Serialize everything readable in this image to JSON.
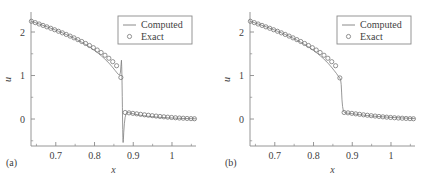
{
  "figure": {
    "panels": [
      {
        "tag": "(a)",
        "name": "panel-a"
      },
      {
        "tag": "(b)",
        "name": "panel-b"
      }
    ],
    "legend": {
      "computed_label": "Computed",
      "exact_label": "Exact"
    },
    "colors": {
      "axis": "#8a8a8a",
      "curve": "#7d7d7d",
      "marker": "#6f6f6f",
      "text": "#3f3f3f",
      "background": "#ffffff"
    }
  },
  "chart_data": [
    {
      "type": "line",
      "title": "(a)",
      "xlabel": "x",
      "ylabel": "u",
      "xlim": [
        0.636,
        1.062
      ],
      "ylim": [
        -0.62,
        2.46
      ],
      "xticks": [
        0.7,
        0.8,
        0.9,
        1.0
      ],
      "xticklabels": [
        "0.7",
        "0.8",
        "0.9",
        "1"
      ],
      "yticks": [
        0,
        1,
        2
      ],
      "yticklabels": [
        "0",
        "1",
        "2"
      ],
      "xminor": [
        0.65,
        0.75,
        0.85,
        0.95,
        1.05
      ],
      "yminor": [
        -0.5,
        0.5,
        1.5
      ],
      "grid": false,
      "legend_position": "upper right",
      "annotations": [
        "oscillatory overshoot and undershoot at the shock near x = 0.872"
      ],
      "series": [
        {
          "name": "Computed",
          "style": "line",
          "x": [
            0.636,
            0.643,
            0.65,
            0.657,
            0.664,
            0.671,
            0.678,
            0.685,
            0.692,
            0.699,
            0.706,
            0.713,
            0.72,
            0.727,
            0.734,
            0.741,
            0.748,
            0.755,
            0.762,
            0.769,
            0.776,
            0.783,
            0.79,
            0.797,
            0.804,
            0.811,
            0.818,
            0.825,
            0.832,
            0.839,
            0.846,
            0.853,
            0.858,
            0.862,
            0.865,
            0.867,
            0.8685,
            0.8695,
            0.8702,
            0.8708,
            0.8712,
            0.8716,
            0.872,
            0.8724,
            0.8728,
            0.8732,
            0.8738,
            0.8745,
            0.8755,
            0.877,
            0.879,
            0.8815,
            0.8845,
            0.888,
            0.892,
            0.897,
            0.903,
            0.91,
            0.918,
            0.927,
            0.937,
            0.948,
            0.96,
            0.973,
            0.987,
            1.002,
            1.018,
            1.035,
            1.05,
            1.062
          ],
          "y": [
            2.25,
            2.228,
            2.206,
            2.184,
            2.162,
            2.14,
            2.117,
            2.094,
            2.07,
            2.046,
            2.021,
            1.996,
            1.97,
            1.943,
            1.915,
            1.886,
            1.856,
            1.824,
            1.791,
            1.756,
            1.719,
            1.68,
            1.639,
            1.596,
            1.55,
            1.501,
            1.449,
            1.393,
            1.333,
            1.268,
            1.196,
            1.118,
            1.062,
            1.022,
            1.01,
            1.08,
            1.25,
            1.352,
            1.2,
            0.98,
            0.76,
            0.52,
            0.26,
            0.0,
            -0.24,
            -0.43,
            -0.54,
            -0.47,
            -0.3,
            -0.11,
            0.04,
            0.12,
            0.15,
            0.148,
            0.138,
            0.126,
            0.114,
            0.101,
            0.088,
            0.076,
            0.065,
            0.055,
            0.045,
            0.037,
            0.029,
            0.023,
            0.017,
            0.012,
            0.008,
            0.005
          ]
        },
        {
          "name": "Exact",
          "style": "circles",
          "x": [
            0.637,
            0.647,
            0.657,
            0.667,
            0.677,
            0.687,
            0.697,
            0.707,
            0.717,
            0.727,
            0.737,
            0.747,
            0.757,
            0.767,
            0.777,
            0.787,
            0.797,
            0.807,
            0.817,
            0.827,
            0.837,
            0.847,
            0.857,
            0.868,
            0.879,
            0.889,
            0.899,
            0.909,
            0.919,
            0.929,
            0.939,
            0.949,
            0.959,
            0.969,
            0.979,
            0.989,
            0.999,
            1.009,
            1.019,
            1.029,
            1.039,
            1.049,
            1.058
          ],
          "y": [
            2.247,
            2.216,
            2.184,
            2.152,
            2.119,
            2.086,
            2.052,
            2.017,
            1.981,
            1.944,
            1.906,
            1.866,
            1.825,
            1.782,
            1.737,
            1.69,
            1.64,
            1.586,
            1.529,
            1.466,
            1.397,
            1.318,
            1.225,
            0.955,
            0.15,
            0.142,
            0.13,
            0.119,
            0.108,
            0.097,
            0.087,
            0.077,
            0.068,
            0.059,
            0.051,
            0.043,
            0.036,
            0.029,
            0.023,
            0.018,
            0.013,
            0.009,
            0.006
          ]
        }
      ]
    },
    {
      "type": "line",
      "title": "(b)",
      "xlabel": "x",
      "ylabel": "u",
      "xlim": [
        0.636,
        1.062
      ],
      "ylim": [
        -0.62,
        2.46
      ],
      "xticks": [
        0.7,
        0.8,
        0.9,
        1.0
      ],
      "xticklabels": [
        "0.7",
        "0.8",
        "0.9",
        "1"
      ],
      "yticks": [
        0,
        1,
        2
      ],
      "yticklabels": [
        "0",
        "1",
        "2"
      ],
      "xminor": [
        0.65,
        0.75,
        0.85,
        0.95,
        1.05
      ],
      "yminor": [
        -0.5,
        0.5,
        1.5
      ],
      "grid": false,
      "legend_position": "upper right",
      "annotations": [
        "monotone non-oscillatory shock capture near x = 0.872"
      ],
      "series": [
        {
          "name": "Computed",
          "style": "line",
          "x": [
            0.636,
            0.643,
            0.65,
            0.657,
            0.664,
            0.671,
            0.678,
            0.685,
            0.692,
            0.699,
            0.706,
            0.713,
            0.72,
            0.727,
            0.734,
            0.741,
            0.748,
            0.755,
            0.762,
            0.769,
            0.776,
            0.783,
            0.79,
            0.797,
            0.804,
            0.811,
            0.818,
            0.825,
            0.832,
            0.839,
            0.846,
            0.853,
            0.859,
            0.864,
            0.868,
            0.87,
            0.8715,
            0.8725,
            0.8735,
            0.875,
            0.877,
            0.88,
            0.884,
            0.889,
            0.895,
            0.902,
            0.91,
            0.919,
            0.929,
            0.94,
            0.952,
            0.965,
            0.979,
            0.994,
            1.01,
            1.027,
            1.044,
            1.056,
            1.062
          ],
          "y": [
            2.25,
            2.228,
            2.206,
            2.184,
            2.162,
            2.14,
            2.117,
            2.094,
            2.07,
            2.046,
            2.021,
            1.996,
            1.97,
            1.943,
            1.915,
            1.886,
            1.856,
            1.824,
            1.791,
            1.756,
            1.719,
            1.68,
            1.639,
            1.596,
            1.55,
            1.501,
            1.449,
            1.393,
            1.333,
            1.268,
            1.196,
            1.118,
            1.05,
            0.985,
            0.94,
            0.9,
            0.79,
            0.62,
            0.44,
            0.29,
            0.19,
            0.148,
            0.14,
            0.134,
            0.127,
            0.119,
            0.11,
            0.1,
            0.09,
            0.08,
            0.069,
            0.059,
            0.05,
            0.041,
            0.033,
            0.025,
            0.018,
            0.012,
            0.008
          ]
        },
        {
          "name": "Exact",
          "style": "circles",
          "x": [
            0.637,
            0.647,
            0.657,
            0.667,
            0.677,
            0.687,
            0.697,
            0.707,
            0.717,
            0.727,
            0.737,
            0.747,
            0.757,
            0.767,
            0.777,
            0.787,
            0.797,
            0.807,
            0.817,
            0.827,
            0.837,
            0.847,
            0.857,
            0.868,
            0.879,
            0.889,
            0.899,
            0.909,
            0.919,
            0.929,
            0.939,
            0.949,
            0.959,
            0.969,
            0.979,
            0.989,
            0.999,
            1.009,
            1.019,
            1.029,
            1.039,
            1.049,
            1.058
          ],
          "y": [
            2.247,
            2.216,
            2.184,
            2.152,
            2.119,
            2.086,
            2.052,
            2.017,
            1.981,
            1.944,
            1.906,
            1.866,
            1.825,
            1.782,
            1.737,
            1.69,
            1.64,
            1.586,
            1.529,
            1.466,
            1.397,
            1.318,
            1.225,
            0.945,
            0.15,
            0.142,
            0.13,
            0.119,
            0.108,
            0.097,
            0.087,
            0.077,
            0.068,
            0.059,
            0.051,
            0.043,
            0.036,
            0.029,
            0.023,
            0.018,
            0.013,
            0.009,
            0.006
          ]
        }
      ]
    }
  ]
}
